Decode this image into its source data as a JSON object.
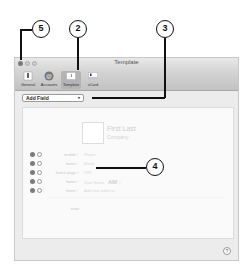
{
  "window": {
    "title": "Template"
  },
  "toolbar": {
    "items": [
      {
        "label": "General",
        "icon": "general-switch-icon",
        "selected": false
      },
      {
        "label": "Accounts",
        "icon": "accounts-at-icon",
        "selected": false
      },
      {
        "label": "Template",
        "icon": "template-card-icon",
        "selected": true
      },
      {
        "label": "vCard",
        "icon": "vcard-icon",
        "selected": false
      }
    ]
  },
  "add_field": {
    "label": "Add Field",
    "chevron": "▾"
  },
  "card": {
    "name": "First Last",
    "company": "Company"
  },
  "fields": [
    {
      "label": "mobile ⁝",
      "value": "Phone"
    },
    {
      "label": "home ⁝",
      "value": "Email"
    },
    {
      "label": "home page ⁝",
      "value": "URL"
    },
    {
      "label": "home ⁝",
      "value": "User Name",
      "extra": "AIM ⁝"
    },
    {
      "label": "home ⁝",
      "value": "Add new address"
    }
  ],
  "note": {
    "label": "note:"
  },
  "help": {
    "label": "?"
  },
  "callouts": {
    "c5": "5",
    "c2": "2",
    "c3": "3",
    "c4": "4"
  }
}
